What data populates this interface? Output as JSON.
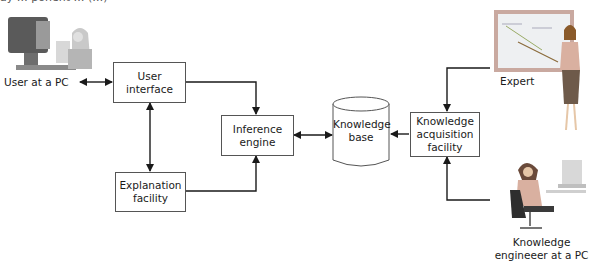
{
  "caption_fragment": "ay … ponent … (…)",
  "nodes": {
    "user_pc": {
      "label": "User at a  PC",
      "icon": "user-at-computer-illustration"
    },
    "user_interface": {
      "line1": "User",
      "line2": "interface"
    },
    "explanation_facility": {
      "line1": "Explanation",
      "line2": "facility"
    },
    "inference_engine": {
      "line1": "Inference",
      "line2": "engine"
    },
    "knowledge_base": {
      "line1": "Knowledge",
      "line2": "base",
      "shape": "cylinder"
    },
    "knowledge_acquisition": {
      "line1": "Knowledge",
      "line2": "acquisition",
      "line3": "facility"
    },
    "expert": {
      "label": "Expert",
      "icon": "expert-at-whiteboard-illustration"
    },
    "knowledge_engineer": {
      "line1": "Knowledge",
      "line2": "engineeer at a PC",
      "icon": "engineer-at-computer-illustration"
    }
  },
  "edges": [
    {
      "from": "user_pc",
      "to": "user_interface",
      "type": "bidirectional"
    },
    {
      "from": "user_interface",
      "to": "explanation_facility",
      "type": "bidirectional"
    },
    {
      "from": "user_interface",
      "to": "inference_engine",
      "type": "directed"
    },
    {
      "from": "explanation_facility",
      "to": "inference_engine",
      "type": "directed"
    },
    {
      "from": "inference_engine",
      "to": "knowledge_base",
      "type": "bidirectional"
    },
    {
      "from": "knowledge_acquisition",
      "to": "knowledge_base",
      "type": "directed"
    },
    {
      "from": "expert",
      "to": "knowledge_acquisition",
      "type": "directed"
    },
    {
      "from": "knowledge_engineer",
      "to": "knowledge_acquisition",
      "type": "directed"
    }
  ],
  "colors": {
    "line": "#1a1a1a",
    "box_border": "#555555",
    "board_frame": "#c9a9a0",
    "screen": "#6b6b6b"
  }
}
